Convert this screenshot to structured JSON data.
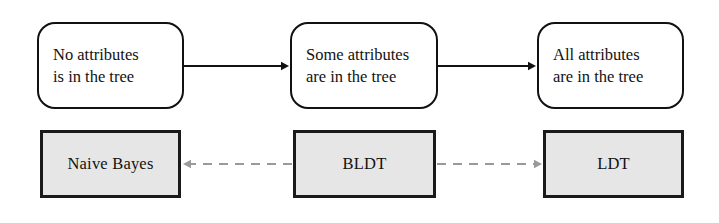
{
  "diagram": {
    "states": [
      {
        "id": "no-attributes",
        "line1": "No attributes",
        "line2": "is in the tree",
        "x": 37,
        "y": 22,
        "w": 147,
        "h": 87
      },
      {
        "id": "some-attributes",
        "line1": "Some attributes",
        "line2": "are in the tree",
        "x": 290,
        "y": 22,
        "w": 148,
        "h": 87
      },
      {
        "id": "all-attributes",
        "line1": "All attributes",
        "line2": "are in the tree",
        "x": 537,
        "y": 22,
        "w": 147,
        "h": 87
      }
    ],
    "algorithms": [
      {
        "id": "naive-bayes",
        "label": "Naive Bayes",
        "x": 40,
        "y": 130,
        "w": 141,
        "h": 68
      },
      {
        "id": "bldt",
        "label": "BLDT",
        "x": 293,
        "y": 130,
        "w": 143,
        "h": 68
      },
      {
        "id": "ldt",
        "label": "LDT",
        "x": 543,
        "y": 130,
        "w": 141,
        "h": 68
      }
    ],
    "connectors": [
      {
        "id": "state-arrow-1",
        "style": "solid",
        "from": "no-attributes",
        "to": "some-attributes",
        "x1": 184,
        "x2": 289,
        "y": 66,
        "arrow_end": "right",
        "color": "#111111"
      },
      {
        "id": "state-arrow-2",
        "style": "solid",
        "from": "some-attributes",
        "to": "all-attributes",
        "x1": 438,
        "x2": 536,
        "y": 66,
        "arrow_end": "right",
        "color": "#111111"
      },
      {
        "id": "algo-dashed-left",
        "style": "dashed",
        "from": "bldt",
        "to": "naive-bayes",
        "x1": 292,
        "x2": 183,
        "y": 164,
        "arrow_end": "left",
        "color": "#9a9a9a"
      },
      {
        "id": "algo-dashed-right",
        "style": "dashed",
        "from": "bldt",
        "to": "ldt",
        "x1": 437,
        "x2": 542,
        "y": 164,
        "arrow_end": "right",
        "color": "#9a9a9a"
      }
    ],
    "colors": {
      "background": "#ffffff",
      "state_border": "#111111",
      "state_fill": "#ffffff",
      "algo_border": "#1a1a1a",
      "algo_fill": "#e6e6e6",
      "solid_arrow": "#111111",
      "dashed_arrow": "#9a9a9a",
      "text": "#121212"
    }
  }
}
